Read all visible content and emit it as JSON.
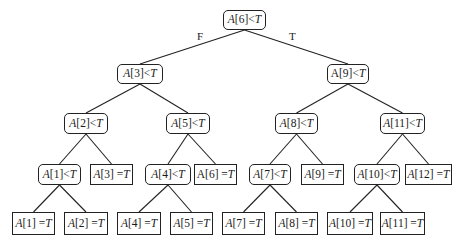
{
  "diagram": {
    "type": "binary-search-decision-tree",
    "edge_labels": [
      {
        "id": "root-left",
        "text": "F",
        "x": 197,
        "y": 30
      },
      {
        "id": "root-right",
        "text": "T",
        "x": 289,
        "y": 30
      }
    ],
    "nodes": [
      {
        "id": "n6lt",
        "kind": "decision",
        "array": "A",
        "index": "6",
        "op": "<",
        "var": "T",
        "upright_a": false,
        "x": 223,
        "y": 10,
        "w": 43,
        "h": 20
      },
      {
        "id": "n3lt",
        "kind": "decision",
        "array": "A",
        "index": "3",
        "op": "<",
        "var": "T",
        "upright_a": false,
        "x": 117,
        "y": 64,
        "w": 46,
        "h": 20
      },
      {
        "id": "n9lt",
        "kind": "decision",
        "array": "A",
        "index": "9",
        "op": "<",
        "var": "T",
        "upright_a": true,
        "x": 327,
        "y": 64,
        "w": 42,
        "h": 20
      },
      {
        "id": "n2lt",
        "kind": "decision",
        "array": "A",
        "index": "2",
        "op": "<",
        "var": "T",
        "upright_a": false,
        "x": 64,
        "y": 113,
        "w": 44,
        "h": 21
      },
      {
        "id": "n5lt",
        "kind": "decision",
        "array": "A",
        "index": "5",
        "op": "<",
        "var": "T",
        "upright_a": false,
        "x": 166,
        "y": 113,
        "w": 44,
        "h": 21
      },
      {
        "id": "n8lt",
        "kind": "decision",
        "array": "A",
        "index": "8",
        "op": "<",
        "var": "T",
        "upright_a": false,
        "x": 275,
        "y": 113,
        "w": 43,
        "h": 21
      },
      {
        "id": "n11lt",
        "kind": "decision",
        "array": "A",
        "index": "11",
        "op": "<",
        "var": "T",
        "upright_a": false,
        "x": 380,
        "y": 113,
        "w": 45,
        "h": 21
      },
      {
        "id": "n1lt",
        "kind": "decision",
        "array": "A",
        "index": "1",
        "op": "<",
        "var": "T",
        "upright_a": false,
        "x": 38,
        "y": 164,
        "w": 43,
        "h": 21
      },
      {
        "id": "n3eq",
        "kind": "leaf",
        "array": "A",
        "index": "3",
        "op": "=",
        "var": "T",
        "upright_a": false,
        "x": 90,
        "y": 164,
        "w": 43,
        "h": 21
      },
      {
        "id": "n4lt",
        "kind": "decision",
        "array": "A",
        "index": "4",
        "op": "<",
        "var": "T",
        "upright_a": false,
        "x": 145,
        "y": 164,
        "w": 46,
        "h": 21
      },
      {
        "id": "n6eq",
        "kind": "leaf",
        "array": "A",
        "index": "6",
        "op": "=",
        "var": "T",
        "upright_a": true,
        "x": 194,
        "y": 164,
        "w": 43,
        "h": 21
      },
      {
        "id": "n7lt",
        "kind": "decision",
        "array": "A",
        "index": "7",
        "op": "<",
        "var": "T",
        "upright_a": false,
        "x": 249,
        "y": 164,
        "w": 42,
        "h": 21
      },
      {
        "id": "n9eq",
        "kind": "leaf",
        "array": "A",
        "index": "9",
        "op": "=",
        "var": "T",
        "upright_a": false,
        "x": 301,
        "y": 164,
        "w": 43,
        "h": 21
      },
      {
        "id": "n10lt",
        "kind": "decision",
        "array": "A",
        "index": "10",
        "op": "<",
        "var": "T",
        "upright_a": false,
        "x": 354,
        "y": 164,
        "w": 46,
        "h": 21
      },
      {
        "id": "n12eq",
        "kind": "leaf",
        "array": "A",
        "index": "12",
        "op": "=",
        "var": "T",
        "upright_a": false,
        "x": 405,
        "y": 164,
        "w": 47,
        "h": 21
      },
      {
        "id": "n1eq",
        "kind": "leaf",
        "array": "A",
        "index": "1",
        "op": "=",
        "var": "T",
        "upright_a": false,
        "x": 12,
        "y": 212,
        "w": 43,
        "h": 23
      },
      {
        "id": "n2eq",
        "kind": "leaf",
        "array": "A",
        "index": "2",
        "op": "=",
        "var": "T",
        "upright_a": false,
        "x": 64,
        "y": 212,
        "w": 44,
        "h": 23
      },
      {
        "id": "n4eq",
        "kind": "leaf",
        "array": "A",
        "index": "4",
        "op": "=",
        "var": "T",
        "upright_a": false,
        "x": 117,
        "y": 212,
        "w": 44,
        "h": 23
      },
      {
        "id": "n5eq",
        "kind": "leaf",
        "array": "A",
        "index": "5",
        "op": "=",
        "var": "T",
        "upright_a": false,
        "x": 170,
        "y": 212,
        "w": 43,
        "h": 23
      },
      {
        "id": "n7eq",
        "kind": "leaf",
        "array": "A",
        "index": "7",
        "op": "=",
        "var": "T",
        "upright_a": false,
        "x": 222,
        "y": 212,
        "w": 43,
        "h": 23
      },
      {
        "id": "n8eq",
        "kind": "leaf",
        "array": "A",
        "index": "8",
        "op": "=",
        "var": "T",
        "upright_a": false,
        "x": 275,
        "y": 212,
        "w": 43,
        "h": 23
      },
      {
        "id": "n10eq",
        "kind": "leaf",
        "array": "A",
        "index": "10",
        "op": "=",
        "var": "T",
        "upright_a": false,
        "x": 327,
        "y": 212,
        "w": 46,
        "h": 23
      },
      {
        "id": "n11eq",
        "kind": "leaf",
        "array": "A",
        "index": "11",
        "op": "=",
        "var": "T",
        "upright_a": false,
        "x": 380,
        "y": 212,
        "w": 45,
        "h": 23
      }
    ],
    "edges": [
      [
        "n6lt",
        "n3lt"
      ],
      [
        "n6lt",
        "n9lt"
      ],
      [
        "n3lt",
        "n2lt"
      ],
      [
        "n3lt",
        "n5lt"
      ],
      [
        "n9lt",
        "n8lt"
      ],
      [
        "n9lt",
        "n11lt"
      ],
      [
        "n2lt",
        "n1lt"
      ],
      [
        "n2lt",
        "n3eq"
      ],
      [
        "n5lt",
        "n4lt"
      ],
      [
        "n5lt",
        "n6eq"
      ],
      [
        "n8lt",
        "n7lt"
      ],
      [
        "n8lt",
        "n9eq"
      ],
      [
        "n11lt",
        "n10lt"
      ],
      [
        "n11lt",
        "n12eq"
      ],
      [
        "n1lt",
        "n1eq"
      ],
      [
        "n1lt",
        "n2eq"
      ],
      [
        "n4lt",
        "n4eq"
      ],
      [
        "n4lt",
        "n5eq"
      ],
      [
        "n7lt",
        "n7eq"
      ],
      [
        "n7lt",
        "n8eq"
      ],
      [
        "n10lt",
        "n10eq"
      ],
      [
        "n10lt",
        "n11eq"
      ]
    ]
  }
}
